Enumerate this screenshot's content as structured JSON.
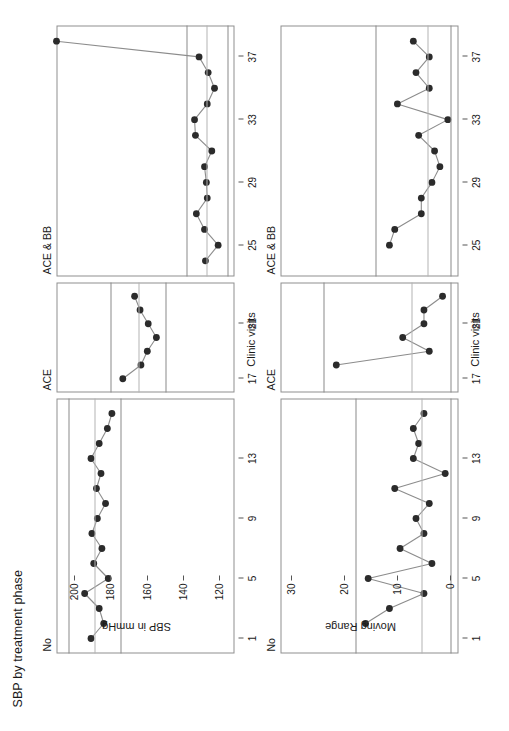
{
  "figure": {
    "title": "SBP by treatment phase",
    "type": "individuals-and-moving-range-control-chart"
  },
  "stages": [
    {
      "key": "none",
      "label": "No",
      "x_from": 1,
      "x_to": 16
    },
    {
      "key": "ace",
      "label": "ACE",
      "x_from": 17,
      "x_to": 23
    },
    {
      "key": "bb",
      "label": "ACE & BB",
      "x_from": 24,
      "x_to": 38
    }
  ],
  "x_axis": {
    "label": "Clinic visits",
    "ticks": [
      1,
      5,
      9,
      13,
      17,
      21,
      25,
      29,
      33,
      37
    ],
    "min": 1,
    "max": 38
  },
  "individuals_chart": {
    "y_label": "SBP in mmHg",
    "y_ticks": [
      200,
      180,
      160,
      140,
      120
    ],
    "y_min": 112,
    "y_max": 210,
    "limit_notes": [
      {
        "name": "ucl",
        "text": "UCL = 138.7",
        "value": 138.7
      },
      {
        "name": "center",
        "text": "X̅ = 127.2",
        "value": 127.2
      },
      {
        "name": "lcl",
        "text": "LCL = 115.8",
        "value": 115.8
      }
    ],
    "stage_limits": [
      {
        "key": "none",
        "ucl": 203.5,
        "center": 189.0,
        "lcl": 174.5
      },
      {
        "key": "ace",
        "ucl": 180.0,
        "center": 165.0,
        "lcl": 150.0
      },
      {
        "key": "bb",
        "ucl": 138.7,
        "center": 127.2,
        "lcl": 115.8
      }
    ]
  },
  "moving_range_chart": {
    "y_label": "Moving Range",
    "y_ticks": [
      30,
      20,
      10,
      0
    ],
    "y_min": -1.5,
    "y_max": 32,
    "limit_notes": [
      {
        "name": "ucl",
        "text": "UCL = 14.07",
        "value": 14.07
      },
      {
        "name": "center",
        "text": "MR̅=4.31",
        "value": 4.31
      },
      {
        "name": "lcl",
        "text": "LCL = 0",
        "value": 0
      }
    ],
    "stage_limits": [
      {
        "key": "none",
        "ucl": 17.8,
        "center": 5.45,
        "lcl": 0
      },
      {
        "key": "ace",
        "ucl": 24.0,
        "center": 7.35,
        "lcl": 0
      },
      {
        "key": "bb",
        "ucl": 14.07,
        "center": 4.31,
        "lcl": 0
      }
    ]
  },
  "chart_data": {
    "type": "line",
    "title": "SBP by treatment phase",
    "xlabel": "Clinic visits",
    "subcharts": [
      {
        "name": "individuals",
        "ylabel": "SBP in mmHg",
        "ylim": [
          112,
          210
        ],
        "yticks": [
          120,
          140,
          160,
          180,
          200
        ],
        "x": [
          1,
          2,
          3,
          4,
          5,
          6,
          7,
          8,
          9,
          10,
          11,
          12,
          13,
          14,
          15,
          16,
          17,
          18,
          19,
          20,
          21,
          22,
          23,
          24,
          25,
          26,
          27,
          28,
          29,
          30,
          31,
          32,
          33,
          34,
          35,
          36,
          37,
          38
        ],
        "values": [
          191.0,
          184.0,
          186.5,
          194.5,
          181.5,
          189.5,
          185.0,
          190.5,
          187.5,
          183.0,
          188.0,
          185.5,
          191.0,
          186.5,
          182.0,
          179.5,
          173.5,
          163.5,
          160.0,
          155.0,
          159.5,
          164.0,
          167.0,
          128.0,
          121.0,
          128.5,
          133.0,
          127.0,
          127.5,
          128.5,
          124.5,
          133.5,
          134.0,
          127.0,
          123.0,
          126.5,
          131.5
        ],
        "grid": false
      },
      {
        "name": "moving_range",
        "ylabel": "Moving Range",
        "ylim": [
          -1.5,
          32
        ],
        "yticks": [
          0,
          10,
          20,
          30
        ],
        "x": [
          2,
          3,
          4,
          5,
          6,
          7,
          8,
          9,
          10,
          11,
          12,
          13,
          14,
          15,
          16,
          18,
          19,
          20,
          21,
          22,
          23,
          25,
          26,
          27,
          28,
          29,
          30,
          31,
          32,
          33,
          34,
          35,
          36,
          37,
          38
        ],
        "values": [
          16.0,
          11.5,
          5.0,
          15.5,
          3.5,
          9.5,
          5.0,
          6.5,
          4.0,
          10.5,
          1.0,
          7.0,
          6.0,
          7.0,
          5.0,
          21.5,
          4.0,
          9.0,
          5.0,
          5.0,
          1.5,
          11.5,
          10.5,
          5.5,
          5.5,
          3.5,
          2.0,
          3.0,
          6.0,
          0.5,
          10.0,
          4.0,
          6.5,
          4.0,
          7.0
        ],
        "grid": false
      }
    ],
    "phases": [
      {
        "label": "No",
        "range": [
          1,
          16
        ]
      },
      {
        "label": "ACE",
        "range": [
          17,
          23
        ]
      },
      {
        "label": "ACE & BB",
        "range": [
          24,
          38
        ]
      }
    ],
    "annotations": [
      "UCL = 138.7",
      "X̅ = 127.2",
      "LCL = 115.8",
      "UCL = 14.07",
      "MR̅=4.31",
      "LCL = 0"
    ]
  }
}
